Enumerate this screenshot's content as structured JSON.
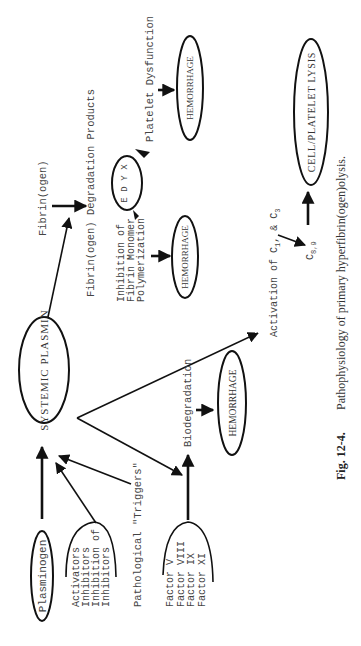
{
  "figure": {
    "number": "Fig. 12-4.",
    "caption": "Pathophysiology of primary hyperfibrin(ogen)olysis."
  },
  "nodes": {
    "plasminogen": "Plasminogen",
    "systemic_plasmin": "SYSTEMIC PLASMIN",
    "hemorrhage_1": "HEMORRHAGE",
    "hemorrhage_2": "HEMORRHAGE",
    "hemorrhage_3": "HEMORRHAGE",
    "cell_platelet_lysis": "CELL/PLATELET LYSIS",
    "xyde": [
      "X",
      "Y",
      "D",
      "E"
    ]
  },
  "labels": {
    "modulators": [
      "Activators",
      "Inhibitors",
      "Inhibition of",
      "Inhibitors"
    ],
    "triggers": "Pathological \"Triggers\"",
    "factors": [
      "Factor V",
      "Factor VIII",
      "Factor IX",
      "Factor XI"
    ],
    "biodegradation": "Biodegradation",
    "fibrinogen": "Fibrin(ogen)",
    "fdp": "Fibrin(ogen) Degradation Products",
    "inhibition": [
      "Inhibition of",
      "Fibrin Monomer",
      "Polymerization"
    ],
    "platelet_dysfunction": "Platelet Dysfunction",
    "activation": "Activation of C",
    "activation_sub1": "1",
    "activation_mid": ", & C",
    "activation_sub2": "3",
    "c89": "C",
    "c89_sub": "8,9"
  }
}
